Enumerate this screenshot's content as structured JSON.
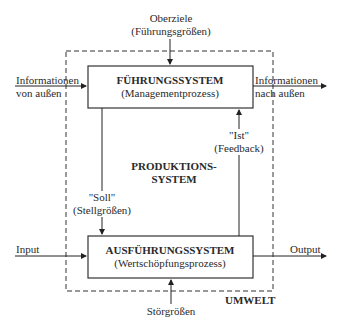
{
  "diagram": {
    "top_input": {
      "line1": "Oberziele",
      "line2": "(Führungsgrößen)"
    },
    "leadership_system": {
      "title": "FÜHRUNGSSYSTEM",
      "subtitle": "(Managementprozess)"
    },
    "execution_system": {
      "title": "AUSFÜHRUNGSSYSTEM",
      "subtitle": "(Wertschöpfungsprozess)"
    },
    "production_system": {
      "line1": "PRODUKTIONS-",
      "line2": "SYSTEM"
    },
    "info_in": {
      "line1": "Informationen",
      "line2": "von außen"
    },
    "info_out": {
      "line1": "Informationen",
      "line2": "nach außen"
    },
    "target": {
      "line1": "\"Soll\"",
      "line2": "(Stellgrößen)"
    },
    "actual": {
      "line1": "\"Ist\"",
      "line2": "(Feedback)"
    },
    "input_label": "Input",
    "output_label": "Output",
    "disturbance_label": "Störgrößen",
    "environment_label": "UMWELT"
  }
}
